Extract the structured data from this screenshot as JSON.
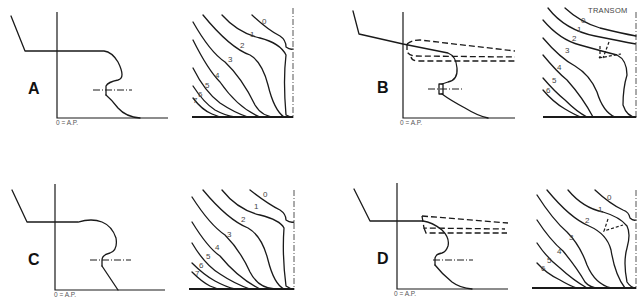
{
  "diagram": {
    "type": "ship stern profiles with body plan sections",
    "axis_label": "0 = A.P.",
    "panels": [
      {
        "id": "A",
        "label": "A",
        "section_labels": [
          "0",
          "1",
          "2",
          "3",
          "4",
          "5",
          "6",
          "7"
        ],
        "extra_label": null,
        "rudder_outline": "none"
      },
      {
        "id": "B",
        "label": "B",
        "section_labels": [
          "0",
          "1",
          "2",
          "3",
          "4",
          "5",
          "6"
        ],
        "extra_label": "TRANSOM",
        "rudder_outline": "dashed overhang"
      },
      {
        "id": "C",
        "label": "C",
        "section_labels": [
          "0",
          "1",
          "2",
          "3",
          "4",
          "5",
          "6",
          "7"
        ],
        "extra_label": null,
        "rudder_outline": "none"
      },
      {
        "id": "D",
        "label": "D",
        "section_labels": [
          "0",
          "1",
          "2",
          "3",
          "4",
          "5",
          "6"
        ],
        "extra_label": null,
        "rudder_outline": "dashed overhang"
      }
    ]
  },
  "labels": {
    "A": "A",
    "B": "B",
    "C": "C",
    "D": "D",
    "ap": "0 = A.P.",
    "transom": "TRANSOM",
    "s0": "0",
    "s1": "1",
    "s2": "2",
    "s3": "3",
    "s4": "4",
    "s5": "5",
    "s6": "6",
    "s7": "7"
  },
  "colors": {
    "line": "#1a1a1a",
    "text": "#444444",
    "background": "#ffffff"
  }
}
